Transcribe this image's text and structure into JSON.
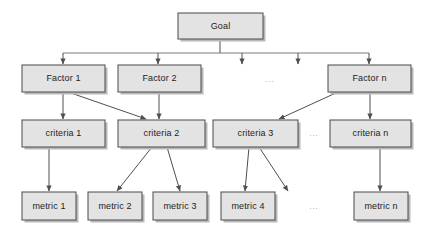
{
  "diagram": {
    "colors": {
      "node_fill": "#e3e3e3",
      "node_border": "#4a4a4a",
      "node_shadow": "#b9b9b9",
      "connector": "#4f4f4f",
      "bus_line": "#7a7a7a",
      "text": "#1c1c1c",
      "ellipsis": "#9a9a9a",
      "background": "#ffffff"
    },
    "levels": [
      {
        "name": "goal-level",
        "nodes": [
          {
            "id": "goal",
            "label": "Goal",
            "x": 178,
            "y": 13,
            "w": 85,
            "h": 26
          }
        ]
      },
      {
        "name": "factor-level",
        "nodes": [
          {
            "id": "factor-1",
            "label": "Factor 1",
            "x": 22,
            "y": 65,
            "w": 83,
            "h": 27
          },
          {
            "id": "factor-2",
            "label": "Factor 2",
            "x": 118,
            "y": 65,
            "w": 83,
            "h": 27
          },
          {
            "id": "factor-n",
            "label": "Factor n",
            "x": 328,
            "y": 65,
            "w": 83,
            "h": 27
          }
        ]
      },
      {
        "name": "criteria-level",
        "nodes": [
          {
            "id": "criteria-1",
            "label": "criteria 1",
            "x": 22,
            "y": 120,
            "w": 83,
            "h": 27
          },
          {
            "id": "criteria-2",
            "label": "criteria 2",
            "x": 118,
            "y": 120,
            "w": 87,
            "h": 27
          },
          {
            "id": "criteria-3",
            "label": "criteria 3",
            "x": 213,
            "y": 120,
            "w": 85,
            "h": 27
          },
          {
            "id": "criteria-n",
            "label": "criteria n",
            "x": 330,
            "y": 120,
            "w": 81,
            "h": 27
          }
        ]
      },
      {
        "name": "metric-level",
        "nodes": [
          {
            "id": "metric-1",
            "label": "metric 1",
            "x": 22,
            "y": 192,
            "w": 54,
            "h": 28
          },
          {
            "id": "metric-2",
            "label": "metric 2",
            "x": 88,
            "y": 192,
            "w": 54,
            "h": 28
          },
          {
            "id": "metric-3",
            "label": "metric 3",
            "x": 153,
            "y": 192,
            "w": 54,
            "h": 28
          },
          {
            "id": "metric-4",
            "label": "metric 4",
            "x": 221,
            "y": 192,
            "w": 54,
            "h": 28
          },
          {
            "id": "metric-n",
            "label": "metric n",
            "x": 354,
            "y": 192,
            "w": 54,
            "h": 28
          }
        ]
      }
    ],
    "ellipses": [
      {
        "id": "ellipsis-factor",
        "label": "...",
        "x": 270,
        "y": 80
      },
      {
        "id": "ellipsis-criteria",
        "label": "...",
        "x": 314,
        "y": 134
      },
      {
        "id": "ellipsis-metric",
        "label": "...",
        "x": 314,
        "y": 207
      }
    ],
    "bus": {
      "id": "goal-distribution-bus",
      "stem_x": 220,
      "stem_y1": 39,
      "stem_y2": 53,
      "line_y": 53,
      "line_x1": 63,
      "line_x2": 369,
      "drops": [
        63,
        158,
        242,
        298,
        369
      ],
      "drop_y2": 64
    },
    "edges": [
      {
        "id": "factor1-to-criteria1",
        "x1": 63,
        "y1": 92,
        "x2": 63,
        "y2": 119
      },
      {
        "id": "factor1-to-criteria2",
        "x1": 68,
        "y1": 92,
        "x2": 146,
        "y2": 119
      },
      {
        "id": "factor2-to-criteria2",
        "x1": 159,
        "y1": 92,
        "x2": 159,
        "y2": 119
      },
      {
        "id": "factorn-to-criteria3",
        "x1": 338,
        "y1": 92,
        "x2": 279,
        "y2": 119
      },
      {
        "id": "factorn-to-criterian",
        "x1": 370,
        "y1": 92,
        "x2": 370,
        "y2": 119
      },
      {
        "id": "criteria1-to-metric1",
        "x1": 49,
        "y1": 147,
        "x2": 49,
        "y2": 191
      },
      {
        "id": "criteria2-to-metric2",
        "x1": 152,
        "y1": 147,
        "x2": 117,
        "y2": 191
      },
      {
        "id": "criteria2-to-metric3",
        "x1": 167,
        "y1": 147,
        "x2": 180,
        "y2": 191
      },
      {
        "id": "criteria3-to-metric4",
        "x1": 249,
        "y1": 147,
        "x2": 245,
        "y2": 191
      },
      {
        "id": "criteria3-to-unlabeled",
        "x1": 259,
        "y1": 147,
        "x2": 288,
        "y2": 191
      },
      {
        "id": "criterian-to-metricn",
        "x1": 380,
        "y1": 147,
        "x2": 380,
        "y2": 191
      }
    ]
  }
}
